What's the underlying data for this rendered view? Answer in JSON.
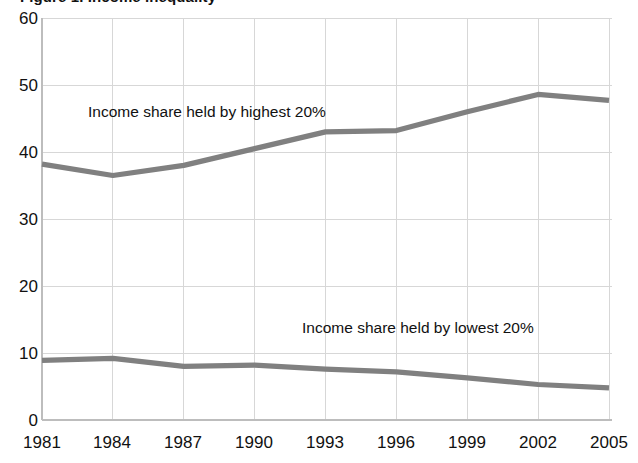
{
  "chart_data": {
    "type": "line",
    "title": "Figure 1. Income inequality",
    "xlabel": "",
    "ylabel": "",
    "categories": [
      "1981",
      "1984",
      "1987",
      "1990",
      "1993",
      "1996",
      "1999",
      "2002",
      "2005"
    ],
    "x_tick_labels": [
      "1981",
      "1984",
      "1987",
      "1990",
      "1993",
      "1996",
      "1999",
      "2002",
      "2005"
    ],
    "y_tick_labels": [
      "0",
      "10",
      "20",
      "30",
      "40",
      "50",
      "60"
    ],
    "y_ticks": [
      0,
      10,
      20,
      30,
      40,
      50,
      60
    ],
    "ylim": [
      0,
      60
    ],
    "grid": true,
    "legend_position": "inline-annotations",
    "series": [
      {
        "name": "Income share held by highest 20%",
        "color": "#808080",
        "values": [
          38.2,
          36.5,
          38.0,
          40.5,
          43.0,
          43.2,
          46.0,
          48.6,
          47.7
        ]
      },
      {
        "name": "Income share held by lowest 20%",
        "color": "#808080",
        "values": [
          8.9,
          9.2,
          8.0,
          8.2,
          7.6,
          7.2,
          6.3,
          5.3,
          4.8
        ]
      }
    ],
    "annotations": [
      {
        "text": "Income share held by highest 20%",
        "x_px": 88,
        "y_px": 104
      },
      {
        "text": "Income share held by lowest 20%",
        "x_px": 302,
        "y_px": 320
      }
    ]
  },
  "colors": {
    "line": "#808080",
    "grid": "#d7d7d7",
    "axis": "#bdbdbd",
    "text": "#111111",
    "background": "#ffffff"
  }
}
